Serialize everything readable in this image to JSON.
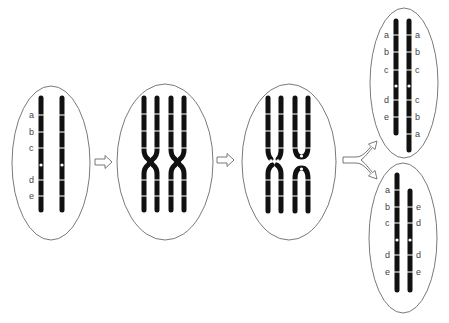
{
  "figure": {
    "type": "meiosis-inversion-diagram",
    "colors": {
      "chromosome": "#111111",
      "band": "#f2f2f2",
      "cell_outline": "#6a6a6a",
      "background": "#ffffff"
    },
    "cells": [
      {
        "id": "cell-1-homologs",
        "left_labels": [
          "a",
          "b",
          "c",
          "d",
          "e"
        ]
      },
      {
        "id": "cell-2-pairing-crossover"
      },
      {
        "id": "cell-3-after-crossover"
      },
      {
        "id": "cell-4-product-top",
        "left_labels": [
          "a",
          "b",
          "c",
          "d",
          "e"
        ],
        "right_labels": [
          "a",
          "b",
          "c",
          "c",
          "b",
          "a"
        ]
      },
      {
        "id": "cell-5-product-bottom",
        "left_labels": [
          "a",
          "b",
          "c",
          "d",
          "e"
        ],
        "right_labels": [
          "e",
          "d",
          "d",
          "e"
        ]
      }
    ],
    "arrows": [
      "arrow-1-right",
      "arrow-2-right",
      "arrow-3-split"
    ]
  }
}
